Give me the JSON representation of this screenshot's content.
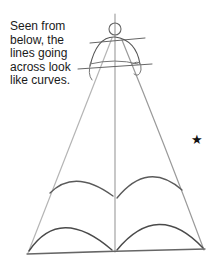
{
  "caption": {
    "lines": [
      "Seen from",
      "below, the",
      "lines going",
      "across look",
      "like curves."
    ]
  },
  "marker": {
    "glyph": "★",
    "icon": "star-icon"
  },
  "colors": {
    "pencil_dark": "#555555",
    "pencil_light": "#aaaaaa",
    "text": "#1a1a1a"
  }
}
